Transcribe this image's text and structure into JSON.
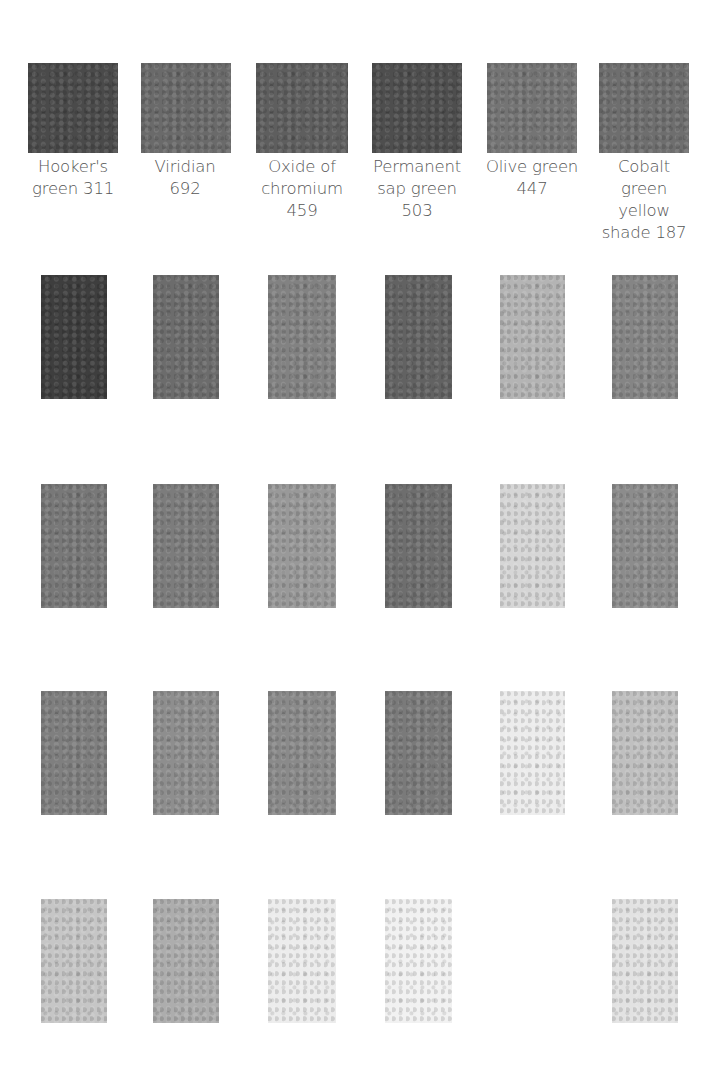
{
  "colors": [
    {
      "label": "Hooker's green 311",
      "lines": [
        "Hooker's",
        "green 311"
      ],
      "swatch": "#4a4a4a",
      "shades": [
        "#3e3e3e",
        "#787878",
        "#7f7f7f",
        "#c6c6c6"
      ]
    },
    {
      "label": "Viridian 692",
      "lines": [
        "Viridian",
        "692"
      ],
      "swatch": "#6a6a6a",
      "shades": [
        "#6c6c6c",
        "#7c7c7c",
        "#8e8e8e",
        "#adadad"
      ]
    },
    {
      "label": "Oxide of chromium 459",
      "lines": [
        "Oxide of",
        "chromium",
        "459"
      ],
      "swatch": "#5e5e5e",
      "shades": [
        "#828282",
        "#999999",
        "#8a8a8a",
        "#ececec"
      ]
    },
    {
      "label": "Permanent sap green 503",
      "lines": [
        "Permanent",
        "sap green",
        "503"
      ],
      "swatch": "#4e4e4e",
      "shades": [
        "#626262",
        "#6e6e6e",
        "#7a7a7a",
        "#f1f1f1"
      ]
    },
    {
      "label": "Olive green 447",
      "lines": [
        "Olive green",
        "447"
      ],
      "swatch": "#747474",
      "shades": [
        "#b4b4b4",
        "#d6d6d6",
        "#ececec",
        "#ffffff"
      ]
    },
    {
      "label": "Cobalt green yellow shade 187",
      "lines": [
        "Cobalt",
        "green",
        "yellow",
        "shade 187"
      ],
      "swatch": "#6e6e6e",
      "shades": [
        "#858585",
        "#8c8c8c",
        "#c0c0c0",
        "#e2e2e2"
      ]
    }
  ]
}
